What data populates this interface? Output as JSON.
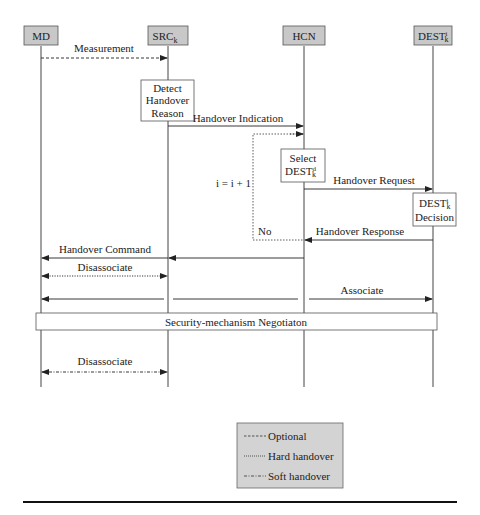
{
  "diagram": {
    "type": "sequence",
    "participants": [
      {
        "id": "md",
        "label": "MD",
        "sup": "",
        "sub": "",
        "x": 41
      },
      {
        "id": "src",
        "label": "SRC",
        "sup": "",
        "sub": "k",
        "x": 168
      },
      {
        "id": "hcn",
        "label": "HCN",
        "sup": "",
        "sub": "",
        "x": 304
      },
      {
        "id": "dest",
        "label": "DEST",
        "sup": "i",
        "sub": "k",
        "x": 433
      }
    ],
    "process_boxes": {
      "detect": {
        "lines": [
          "Detect",
          "Handover",
          "Reason"
        ]
      },
      "select": {
        "line1": "Select",
        "line2_base": "DEST",
        "line2_sup": "d",
        "line2_sub": "k"
      },
      "decision": {
        "line1_base": "DEST",
        "line1_sup": "i",
        "line1_sub": "k",
        "line2": "Decision"
      }
    },
    "messages": [
      {
        "id": "measurement",
        "label": "Measurement",
        "from": "md",
        "to": "src",
        "style": "optional"
      },
      {
        "id": "handover-indication",
        "label": "Handover Indication",
        "from": "src",
        "to": "hcn",
        "style": "solid"
      },
      {
        "id": "handover-request",
        "label": "Handover Request",
        "from": "hcn",
        "to": "dest",
        "style": "solid"
      },
      {
        "id": "handover-response",
        "label": "Handover Response",
        "from": "dest",
        "to": "hcn",
        "style": "solid"
      },
      {
        "id": "handover-command",
        "label": "Handover Command",
        "from": "hcn",
        "to": "md",
        "style": "solid"
      },
      {
        "id": "disassociate-hard",
        "label": "Disassociate",
        "from": "md",
        "to": "src",
        "style": "hard",
        "bidirectional": true
      },
      {
        "id": "associate",
        "label": "Associate",
        "from": "md",
        "to": "dest",
        "style": "solid",
        "bidirectional": true
      },
      {
        "id": "disassociate-soft",
        "label": "Disassociate",
        "from": "md",
        "to": "src",
        "style": "soft",
        "bidirectional": true
      }
    ],
    "loop": {
      "counter_label": "i = i + 1",
      "no_label": "No"
    },
    "security_bar": {
      "label": "Security-mechanism Negotiaton"
    },
    "legend": {
      "items": [
        {
          "style": "optional",
          "label": "Optional"
        },
        {
          "style": "hard",
          "label": "Hard handover"
        },
        {
          "style": "soft",
          "label": "Soft handover"
        }
      ]
    },
    "colors": {
      "header_fill": "#c8c8c8",
      "legend_fill": "#d3d3d3",
      "line": "#333333",
      "text": "#222222"
    }
  }
}
